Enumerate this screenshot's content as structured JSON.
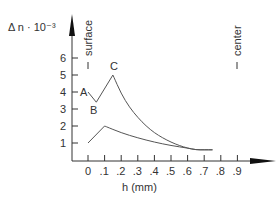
{
  "chart_data": {
    "type": "line",
    "title": "",
    "ylabel": "Δ n · 10⁻³",
    "xlabel": "h (mm)",
    "x_ticks": [
      "0",
      ".1",
      ".2",
      ".3",
      ".4",
      ".5",
      ".6",
      ".7",
      ".8",
      ".9"
    ],
    "y_ticks": [
      "1",
      "2",
      "3",
      "4",
      "5",
      "6"
    ],
    "xlim": [
      -0.1,
      1.1
    ],
    "ylim": [
      0,
      8.5
    ],
    "grid": false,
    "legend": null,
    "annotations": {
      "surface_label": "surface",
      "center_label": "center",
      "point_A": "A",
      "point_B": "B",
      "point_C": "C"
    },
    "series": [
      {
        "name": "upper curve (A-B-C)",
        "x": [
          0.0,
          0.05,
          0.15,
          0.2,
          0.25,
          0.3,
          0.35,
          0.4,
          0.45,
          0.5,
          0.55,
          0.6,
          0.65,
          0.7,
          0.75
        ],
        "y": [
          4.0,
          3.4,
          5.0,
          3.9,
          3.1,
          2.5,
          2.0,
          1.6,
          1.3,
          1.05,
          0.85,
          0.7,
          0.6,
          0.6,
          0.6
        ]
      },
      {
        "name": "lower curve",
        "x": [
          0.0,
          0.1,
          0.2,
          0.3,
          0.4,
          0.5,
          0.6,
          0.65,
          0.7,
          0.75
        ],
        "y": [
          1.0,
          2.0,
          1.6,
          1.3,
          1.05,
          0.85,
          0.7,
          0.6,
          0.6,
          0.6
        ]
      }
    ]
  }
}
